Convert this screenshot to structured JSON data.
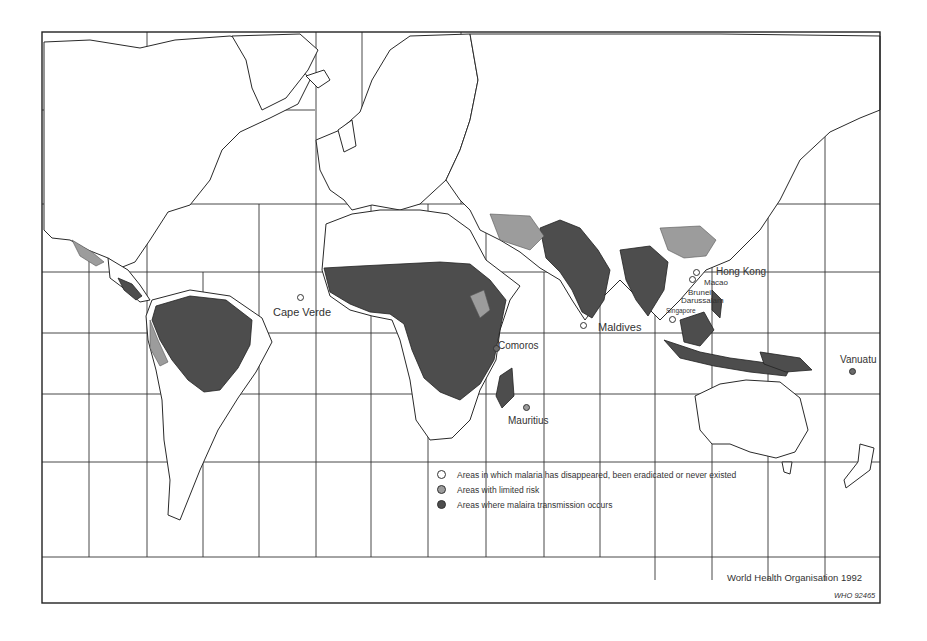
{
  "map": {
    "title": "Malaria distribution world map",
    "source_credit": "World Health Organisation 1992",
    "reference_code": "WHO 92465",
    "colors": {
      "disappeared": "#ffffff",
      "limited_risk": "#9c9c9c",
      "transmission": "#4d4d4d",
      "outline": "#2a2a2a"
    }
  },
  "legend": {
    "items": [
      {
        "label": "Areas in which malaria has disappeared, been eradicated or never existed",
        "color": "#ffffff"
      },
      {
        "label": "Areas with limited risk",
        "color": "#9c9c9c"
      },
      {
        "label": "Areas where malaira transmission occurs",
        "color": "#4d4d4d"
      }
    ]
  },
  "place_labels": {
    "cape_verde": "Cape Verde",
    "comoros": "Comoros",
    "mauritius": "Mauritius",
    "maldives": "Maldives",
    "singapore": "Singapore",
    "brunei_line1": "Brunei",
    "brunei_line2": "Darussalam",
    "macao": "Macao",
    "hong_kong": "Hong Kong",
    "vanuatu": "Vanuatu"
  }
}
